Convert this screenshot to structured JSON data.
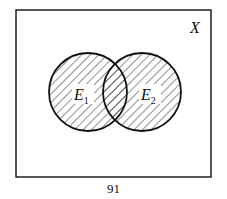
{
  "diagram": {
    "type": "venn",
    "universe_label": "X",
    "sets": [
      {
        "label": "E",
        "subscript": "1",
        "cx": 88,
        "cy": 92,
        "r": 39,
        "shaded": true
      },
      {
        "label": "E",
        "subscript": "2",
        "cx": 142,
        "cy": 92,
        "r": 39,
        "shaded": true
      }
    ],
    "colors": {
      "stroke": "#111111",
      "hatch": "#222222",
      "background": "#ffffff"
    }
  },
  "page_number": "91"
}
